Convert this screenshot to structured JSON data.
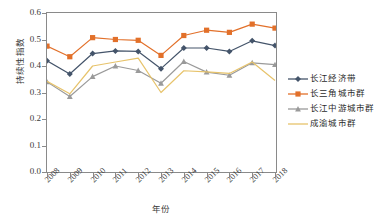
{
  "chart_data": {
    "type": "line",
    "title": "",
    "xlabel": "年份",
    "ylabel": "持续性指数",
    "categories": [
      "2008",
      "2009",
      "2010",
      "2011",
      "2012",
      "2013",
      "2014",
      "2015",
      "2016",
      "2017",
      "2018"
    ],
    "ylim": [
      0.0,
      0.6
    ],
    "yticks": [
      "0.0",
      "0.1",
      "0.2",
      "0.3",
      "0.4",
      "0.5",
      "0.6"
    ],
    "ytick_values": [
      0.0,
      0.1,
      0.2,
      0.3,
      0.4,
      0.5,
      0.6
    ],
    "grid": false,
    "legend_position": "right",
    "series": [
      {
        "name": "长江经济带",
        "color": "#44546A",
        "marker": "diamond",
        "values": [
          0.42,
          0.37,
          0.447,
          0.457,
          0.455,
          0.39,
          0.468,
          0.468,
          0.455,
          0.495,
          0.477
        ]
      },
      {
        "name": "长三角城市群",
        "color": "#E2702A",
        "marker": "square",
        "values": [
          0.475,
          0.435,
          0.507,
          0.5,
          0.497,
          0.44,
          0.515,
          0.535,
          0.527,
          0.558,
          0.543
        ]
      },
      {
        "name": "长江中游城市群",
        "color": "#9A9A9A",
        "marker": "triangle",
        "values": [
          0.34,
          0.285,
          0.36,
          0.4,
          0.383,
          0.335,
          0.417,
          0.377,
          0.365,
          0.412,
          0.405
        ]
      },
      {
        "name": "成渝城市群",
        "color": "#E7C36B",
        "marker": "none",
        "values": [
          0.342,
          0.295,
          0.4,
          0.415,
          0.43,
          0.3,
          0.382,
          0.378,
          0.372,
          0.415,
          0.345
        ]
      }
    ]
  },
  "axes": {
    "y_title": "持续性指数",
    "x_title": "年份"
  },
  "legend": {
    "items": [
      {
        "label": "长江经济带"
      },
      {
        "label": "长三角城市群"
      },
      {
        "label": "长江中游城市群"
      },
      {
        "label": "成渝城市群"
      }
    ]
  }
}
